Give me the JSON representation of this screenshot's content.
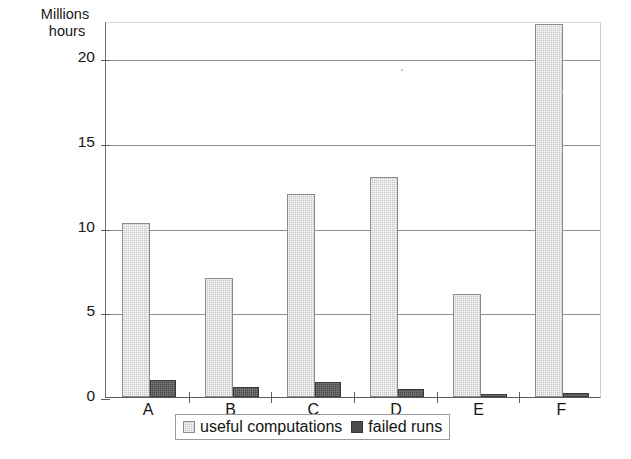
{
  "chart_data": {
    "type": "bar",
    "title": "",
    "xlabel": "",
    "ylabel": "Millions hours",
    "ylabel_lines": [
      "Millions",
      "hours"
    ],
    "categories": [
      "A",
      "B",
      "C",
      "D",
      "E",
      "F"
    ],
    "series": [
      {
        "name": "useful computations",
        "color": "#c9c9c9",
        "values": [
          10.3,
          7.0,
          12.0,
          13.0,
          6.1,
          22.0
        ]
      },
      {
        "name": "failed runs",
        "color": "#4b4b4b",
        "values": [
          1.0,
          0.6,
          0.9,
          0.5,
          0.15,
          0.25
        ]
      }
    ],
    "ylim": [
      0,
      22.2
    ],
    "yticks": [
      0,
      5,
      10,
      15,
      20
    ],
    "ytick_labels": [
      "0",
      "5",
      "10",
      "15",
      "20"
    ],
    "grid": true,
    "legend_position": "bottom"
  },
  "legend": {
    "items": [
      {
        "label": "useful computations",
        "swatch": "light-gray-swatch-icon"
      },
      {
        "label": "failed runs",
        "swatch": "dark-gray-swatch-icon"
      }
    ]
  }
}
